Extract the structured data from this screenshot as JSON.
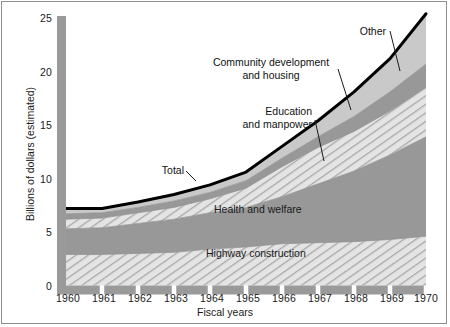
{
  "figure": {
    "background": "#ffffff",
    "border_color": "#8d8d8d"
  },
  "axes": {
    "y_title": "Billions of dollars (estimated)",
    "x_title": "Fiscal years",
    "y_ticks": [
      "0",
      "5",
      "10",
      "15",
      "20",
      "25"
    ],
    "x_ticks": [
      "1960",
      "1961",
      "1962",
      "1963",
      "1964",
      "1965",
      "1966",
      "1967",
      "1968",
      "1969",
      "1970"
    ],
    "axis_bar_color": "#9a9a9a"
  },
  "callouts": {
    "total": "Total",
    "education_line1": "Education",
    "education_line2": "and manpower",
    "community_line1": "Community development",
    "community_line2": "and housing",
    "other": "Other"
  },
  "inner_labels": {
    "health": "Health and welfare",
    "highway": "Highway construction"
  },
  "chart_data": {
    "type": "area",
    "title": "",
    "xlabel": "Fiscal years",
    "ylabel": "Billions of dollars (estimated)",
    "xlim": [
      1960,
      1970
    ],
    "ylim": [
      0,
      25
    ],
    "grid": false,
    "legend": "inline annotations with leader lines",
    "stacked": true,
    "x": [
      1960,
      1961,
      1962,
      1963,
      1964,
      1965,
      1966,
      1967,
      1968,
      1969,
      1970
    ],
    "series": [
      {
        "name": "Highway construction",
        "fill": "hatched-diagonal",
        "color": "#d6d6d6",
        "values": [
          2.9,
          2.9,
          3.0,
          3.1,
          3.4,
          3.6,
          3.9,
          4.0,
          4.1,
          4.3,
          4.6
        ]
      },
      {
        "name": "Health and welfare",
        "fill": "solid",
        "color": "#989898",
        "values": [
          2.4,
          2.5,
          2.8,
          3.1,
          3.4,
          3.7,
          4.4,
          5.5,
          6.6,
          7.9,
          9.3
        ]
      },
      {
        "name": "Education and manpower",
        "fill": "hatched-diagonal",
        "color": "#d6d6d6",
        "values": [
          0.9,
          0.9,
          1.0,
          1.1,
          1.3,
          1.8,
          2.8,
          3.4,
          3.7,
          4.1,
          4.6
        ]
      },
      {
        "name": "Community development and housing",
        "fill": "solid",
        "color": "#989898",
        "values": [
          0.5,
          0.5,
          0.5,
          0.6,
          0.6,
          0.7,
          0.8,
          1.0,
          1.4,
          1.8,
          2.2
        ]
      },
      {
        "name": "Other",
        "fill": "solid-light",
        "color": "#c9c9c9",
        "values": [
          0.5,
          0.4,
          0.5,
          0.6,
          0.7,
          0.8,
          1.1,
          1.5,
          2.3,
          3.1,
          4.7
        ]
      }
    ],
    "total": {
      "name": "Total",
      "values": [
        7.2,
        7.2,
        7.8,
        8.5,
        9.4,
        10.6,
        13.0,
        15.4,
        18.1,
        21.2,
        25.4
      ],
      "line_color": "#000000",
      "line_width": 3
    }
  }
}
